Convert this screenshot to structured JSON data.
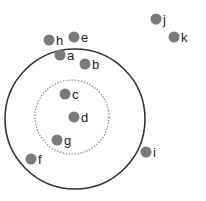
{
  "diagram": {
    "colors": {
      "dot": "#7a7a7a",
      "outer_circle": "#333333",
      "inner_circle": "#888888",
      "label": "#222222"
    },
    "outer_circle": {
      "cx": 75,
      "cy": 119,
      "r": 70
    },
    "inner_circle": {
      "cx": 72,
      "cy": 117,
      "r": 37,
      "style": "dotted"
    },
    "points": [
      {
        "label": "h",
        "x": 49,
        "y": 40
      },
      {
        "label": "e",
        "x": 74,
        "y": 37
      },
      {
        "label": "a",
        "x": 60,
        "y": 55
      },
      {
        "label": "b",
        "x": 85,
        "y": 64
      },
      {
        "label": "c",
        "x": 65,
        "y": 94
      },
      {
        "label": "d",
        "x": 74,
        "y": 117
      },
      {
        "label": "g",
        "x": 57,
        "y": 140
      },
      {
        "label": "f",
        "x": 31,
        "y": 159
      },
      {
        "label": "i",
        "x": 146,
        "y": 152
      },
      {
        "label": "j",
        "x": 156,
        "y": 19
      },
      {
        "label": "k",
        "x": 174,
        "y": 37
      }
    ]
  }
}
